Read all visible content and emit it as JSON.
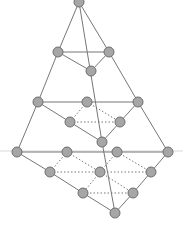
{
  "diagram": {
    "width": 183,
    "height": 227,
    "colors": {
      "node_fill": "#a6a6a6",
      "node_stroke": "#6e6e6e",
      "edge": "#777777",
      "dotted_edge": "#777777",
      "guide_line": "#d9d9d9"
    },
    "guide_line": {
      "x1": 0,
      "y1": 151,
      "x2": 183,
      "y2": 151
    },
    "nodes": [
      {
        "id": "n0",
        "x": 79,
        "y": 2
      },
      {
        "id": "n1",
        "x": 58,
        "y": 52
      },
      {
        "id": "n2",
        "x": 109,
        "y": 52
      },
      {
        "id": "n3",
        "x": 91,
        "y": 71
      },
      {
        "id": "n4",
        "x": 38,
        "y": 102
      },
      {
        "id": "n5",
        "x": 87,
        "y": 102
      },
      {
        "id": "n6",
        "x": 138,
        "y": 102
      },
      {
        "id": "n7",
        "x": 70,
        "y": 122
      },
      {
        "id": "n8",
        "x": 120,
        "y": 122
      },
      {
        "id": "n9",
        "x": 102,
        "y": 142
      },
      {
        "id": "n10",
        "x": 17,
        "y": 152
      },
      {
        "id": "n11",
        "x": 67,
        "y": 152
      },
      {
        "id": "n12",
        "x": 117,
        "y": 152
      },
      {
        "id": "n13",
        "x": 168,
        "y": 152
      },
      {
        "id": "n14",
        "x": 50,
        "y": 172
      },
      {
        "id": "n15",
        "x": 100,
        "y": 172
      },
      {
        "id": "n16",
        "x": 151,
        "y": 172
      },
      {
        "id": "n17",
        "x": 83,
        "y": 193
      },
      {
        "id": "n18",
        "x": 133,
        "y": 193
      },
      {
        "id": "n19",
        "x": 115,
        "y": 213
      }
    ],
    "solid_edges": [
      [
        "n0",
        "n1"
      ],
      [
        "n0",
        "n2"
      ],
      [
        "n0",
        "n9"
      ],
      [
        "n1",
        "n2"
      ],
      [
        "n1",
        "n3"
      ],
      [
        "n3",
        "n2"
      ],
      [
        "n1",
        "n4"
      ],
      [
        "n2",
        "n6"
      ],
      [
        "n4",
        "n5"
      ],
      [
        "n5",
        "n6"
      ],
      [
        "n4",
        "n7"
      ],
      [
        "n7",
        "n9"
      ],
      [
        "n9",
        "n8"
      ],
      [
        "n8",
        "n6"
      ],
      [
        "n4",
        "n10"
      ],
      [
        "n6",
        "n13"
      ],
      [
        "n10",
        "n11"
      ],
      [
        "n11",
        "n12"
      ],
      [
        "n12",
        "n13"
      ],
      [
        "n10",
        "n14"
      ],
      [
        "n14",
        "n17"
      ],
      [
        "n17",
        "n19"
      ],
      [
        "n19",
        "n18"
      ],
      [
        "n18",
        "n16"
      ],
      [
        "n16",
        "n13"
      ],
      [
        "n9",
        "n19"
      ]
    ],
    "dotted_edges": [
      [
        "n5",
        "n7"
      ],
      [
        "n5",
        "n8"
      ],
      [
        "n7",
        "n8"
      ],
      [
        "n11",
        "n14"
      ],
      [
        "n11",
        "n15"
      ],
      [
        "n12",
        "n15"
      ],
      [
        "n12",
        "n16"
      ],
      [
        "n14",
        "n15"
      ],
      [
        "n15",
        "n16"
      ],
      [
        "n15",
        "n17"
      ],
      [
        "n15",
        "n18"
      ],
      [
        "n17",
        "n18"
      ]
    ],
    "node_radius": 5
  }
}
